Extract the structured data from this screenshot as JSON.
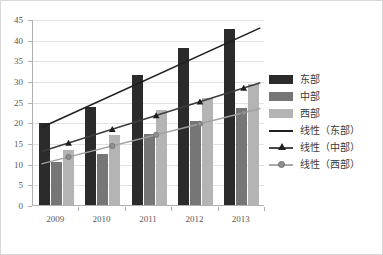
{
  "chart_data": {
    "type": "bar",
    "title": "",
    "subtitle": "",
    "xlabel": "",
    "ylabel": "",
    "categories": [
      "2009",
      "2010",
      "2011",
      "2012",
      "2013"
    ],
    "series": [
      {
        "name": "东部",
        "values": [
          19.8,
          23.7,
          31.5,
          38.1,
          42.5
        ],
        "color": "#2b2b2b"
      },
      {
        "name": "中部",
        "values": [
          10.4,
          12.4,
          17.2,
          20.4,
          23.4
        ],
        "color": "#767676"
      },
      {
        "name": "西部",
        "values": [
          13.2,
          16.9,
          22.9,
          25.8,
          29.2
        ],
        "color": "#b4b4b4"
      }
    ],
    "trendlines": [
      {
        "name": "线性(东部)",
        "start": 19.0,
        "end": 43.1,
        "marker": "none",
        "color": "#1f1f1f"
      },
      {
        "name": "线性(中部)",
        "start": 13.2,
        "end": 29.8,
        "marker": "triangle",
        "color": "#3d3d3d"
      },
      {
        "name": "线性(西部)",
        "start": 10.2,
        "end": 23.6,
        "marker": "circle",
        "color": "#a0a0a0"
      }
    ],
    "ylim": [
      0,
      45
    ],
    "ytick_step": 5,
    "ytick_labels": [
      "45",
      "40",
      "35",
      "30",
      "25",
      "20",
      "15",
      "10",
      "5",
      "0"
    ],
    "grid": true,
    "legend_position": "right"
  },
  "legend": {
    "entries": [
      {
        "label": "东部",
        "kind": "swatch",
        "variant": "east"
      },
      {
        "label": "中部",
        "kind": "swatch",
        "variant": "central"
      },
      {
        "label": "西部",
        "kind": "swatch",
        "variant": "west"
      },
      {
        "label": "线性（东部）",
        "kind": "line",
        "variant": "east",
        "marker": "none"
      },
      {
        "label": "线性（中部）",
        "kind": "line",
        "variant": "central",
        "marker": "triangle"
      },
      {
        "label": "线性（西部）",
        "kind": "line",
        "variant": "west",
        "marker": "circle"
      }
    ]
  },
  "colors": {
    "east_bar": "#2b2b2b",
    "central_bar": "#767676",
    "west_bar": "#b4b4b4",
    "gridline": "#e2e2e2",
    "axis": "#b0b0b0",
    "frame": "#d7d7d7",
    "tick_text": "#595959"
  }
}
